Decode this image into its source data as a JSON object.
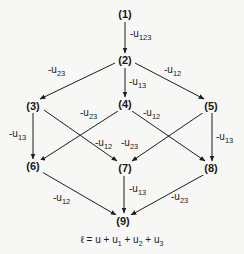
{
  "diagram": {
    "nodes": [
      {
        "id": "1",
        "label": "(1)",
        "x": 125,
        "y": 18
      },
      {
        "id": "2",
        "label": "(2)",
        "x": 125,
        "y": 64
      },
      {
        "id": "3",
        "label": "(3)",
        "x": 33,
        "y": 110
      },
      {
        "id": "4",
        "label": "(4)",
        "x": 125,
        "y": 108
      },
      {
        "id": "5",
        "label": "(5)",
        "x": 211,
        "y": 110
      },
      {
        "id": "6",
        "label": "(6)",
        "x": 33,
        "y": 170
      },
      {
        "id": "7",
        "label": "(7)",
        "x": 125,
        "y": 172
      },
      {
        "id": "8",
        "label": "(8)",
        "x": 211,
        "y": 172
      },
      {
        "id": "9",
        "label": "(9)",
        "x": 123,
        "y": 225
      }
    ],
    "edges": [
      {
        "from": "1",
        "to": "2",
        "label": "-u",
        "sub": "123",
        "x1": 125,
        "y1": 22,
        "x2": 125,
        "y2": 53,
        "lx": 130,
        "ly": 37
      },
      {
        "from": "2",
        "to": "3",
        "label": "-u",
        "sub": "23",
        "x1": 115,
        "y1": 63,
        "x2": 40,
        "y2": 99,
        "lx": 48,
        "ly": 73
      },
      {
        "from": "2",
        "to": "4",
        "label": "-u",
        "sub": "13",
        "x1": 125,
        "y1": 68,
        "x2": 125,
        "y2": 97,
        "lx": 129,
        "ly": 85
      },
      {
        "from": "2",
        "to": "5",
        "label": "-u",
        "sub": "12",
        "x1": 135,
        "y1": 63,
        "x2": 204,
        "y2": 99,
        "lx": 164,
        "ly": 73
      },
      {
        "from": "3",
        "to": "6",
        "label": "-u",
        "sub": "13",
        "x1": 33,
        "y1": 113,
        "x2": 33,
        "y2": 159,
        "lx": 9,
        "ly": 137
      },
      {
        "from": "3",
        "to": "7",
        "label": "-u",
        "sub": "12",
        "x1": 44,
        "y1": 110,
        "x2": 117,
        "y2": 161,
        "lx": 95,
        "ly": 146
      },
      {
        "from": "4",
        "to": "6",
        "label": "-u",
        "sub": "23",
        "x1": 118,
        "y1": 111,
        "x2": 40,
        "y2": 161,
        "lx": 80,
        "ly": 116
      },
      {
        "from": "4",
        "to": "8",
        "label": "-u",
        "sub": "12",
        "x1": 132,
        "y1": 111,
        "x2": 205,
        "y2": 161,
        "lx": 143,
        "ly": 116
      },
      {
        "from": "5",
        "to": "7",
        "label": "-u",
        "sub": "23",
        "x1": 204,
        "y1": 112,
        "x2": 132,
        "y2": 161,
        "lx": 121,
        "ly": 146
      },
      {
        "from": "5",
        "to": "8",
        "label": "-u",
        "sub": "13",
        "x1": 212,
        "y1": 113,
        "x2": 212,
        "y2": 161,
        "lx": 216,
        "ly": 140
      },
      {
        "from": "6",
        "to": "9",
        "label": "-u",
        "sub": "12",
        "x1": 42,
        "y1": 172,
        "x2": 116,
        "y2": 215,
        "lx": 53,
        "ly": 201
      },
      {
        "from": "7",
        "to": "9",
        "label": "-u",
        "sub": "13",
        "x1": 124,
        "y1": 176,
        "x2": 124,
        "y2": 213,
        "lx": 129,
        "ly": 192
      },
      {
        "from": "8",
        "to": "9",
        "label": "-u",
        "sub": "23",
        "x1": 205,
        "y1": 174,
        "x2": 131,
        "y2": 215,
        "lx": 171,
        "ly": 200
      }
    ],
    "formula": {
      "lhs": "ℓ",
      "eq": " = u + u",
      "s1": "1",
      "p2": " + u",
      "s2": "2",
      "p3": " + u",
      "s3": "3"
    }
  }
}
